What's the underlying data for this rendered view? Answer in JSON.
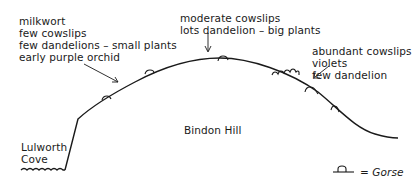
{
  "labels": {
    "left_slope": [
      "milkwort",
      "few cowslips",
      "few dandelions – small plants",
      "early purple orchid"
    ],
    "summit": [
      "moderate cowslips",
      "lots dandelion – big plants"
    ],
    "right_slope": [
      "abundant cowslips",
      "violets",
      "few dandelion"
    ],
    "hill_name": "Bindon Hill",
    "cove": [
      "Lulworth",
      "Cove"
    ]
  },
  "legend": {
    "symbol": "gorse-bush",
    "text": "= Gorse"
  },
  "colors": {
    "ink": "#1a1a1a",
    "background": "#ffffff"
  }
}
